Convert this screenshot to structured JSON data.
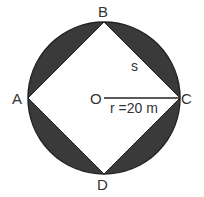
{
  "diagram": {
    "colors": {
      "shaded": "#3a3a3a",
      "stroke": "#222222",
      "background": "#ffffff"
    },
    "labels": {
      "top_vertex": "B",
      "left_vertex": "A",
      "right_vertex": "C",
      "bottom_vertex": "D",
      "center": "O",
      "side": "s",
      "radius": "r =20 m"
    }
  }
}
